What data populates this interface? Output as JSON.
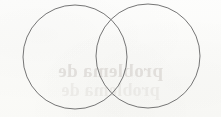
{
  "page": {
    "kind": "scanned-paper-figure",
    "width": 221,
    "height": 117,
    "background_color": "#fdfdfc"
  },
  "diagram": {
    "type": "venn-two-set",
    "stroke_color": "#757575",
    "stroke_width": 1,
    "fill": "none",
    "left_circle": {
      "cx": 75,
      "cy": 57,
      "r": 52,
      "label": ""
    },
    "right_circle": {
      "cx": 148,
      "cy": 56,
      "r": 52,
      "label": ""
    },
    "intersection_points": [
      {
        "x": 110,
        "y": 8
      },
      {
        "x": 110,
        "y": 107
      }
    ],
    "region_labels": {
      "left_only": "",
      "overlap": "",
      "right_only": ""
    }
  },
  "bleed_through": {
    "note_color": "#b9b2ad",
    "mirrored": true,
    "primary_line": "problema de",
    "secondary_line": "problema de"
  }
}
